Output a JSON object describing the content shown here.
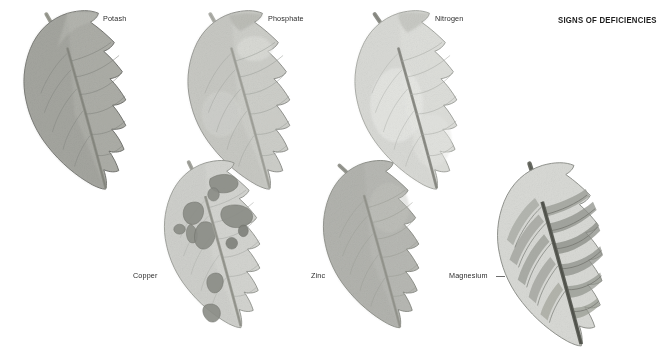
{
  "plate": {
    "title": "SIGNS OF DEFICIENCIES",
    "background_color": "#ffffff",
    "text_color": "#2a2a2a",
    "title_color": "#1d1d1d"
  },
  "specimens": [
    {
      "id": "potash",
      "label": "Potash",
      "row": "top",
      "column": 1,
      "label_x": 103,
      "label_y": 19,
      "blade_tone": "#a9aaa4",
      "blade_tone_light": "#c2c3bd",
      "edge_tone": "#6f716c",
      "vein_tone": "#7d7f79",
      "midrib_tone": "#8c8d86",
      "condition": "uniform dull grey-green blade, darker margins"
    },
    {
      "id": "phosphate",
      "label": "Phosphate",
      "row": "top",
      "column": 2,
      "label_x": 268,
      "label_y": 19,
      "blade_tone": "#cccdc8",
      "blade_tone_light": "#e0e1dd",
      "edge_tone": "#8b8d88",
      "vein_tone": "#9b9d98",
      "midrib_tone": "#a7a8a2",
      "condition": "pale blade, slightly mottled, light margins"
    },
    {
      "id": "nitrogen",
      "label": "Nitrogen",
      "row": "top",
      "column": 3,
      "label_x": 435,
      "label_y": 19,
      "blade_tone": "#dcddd9",
      "blade_tone_light": "#eeefec",
      "edge_tone": "#9a9c97",
      "vein_tone": "#a9aba6",
      "midrib_tone": "#8f908a",
      "condition": "palest blade, overall chlorosis"
    },
    {
      "id": "copper",
      "label": "Copper",
      "row": "bottom",
      "column": 1,
      "label_x": 133,
      "label_y": 276,
      "blade_tone": "#d2d3cf",
      "blade_tone_light": "#e3e4e1",
      "edge_tone": "#8e908b",
      "vein_tone": "#a4a6a1",
      "midrib_tone": "#9d9e97",
      "lesion_tone": "#8a8c86",
      "lesion_edge": "#6b6d67",
      "condition": "pale blade with dark irregular necrotic blotches"
    },
    {
      "id": "zinc",
      "label": "Zinc",
      "row": "bottom",
      "column": 2,
      "label_x": 311,
      "label_y": 276,
      "blade_tone": "#b6b7b2",
      "blade_tone_light": "#c8c9c4",
      "edge_tone": "#84867f",
      "vein_tone": "#95978f",
      "midrib_tone": "#9a9b94",
      "condition": "even mid-grey blade, faint veins"
    },
    {
      "id": "magnesium",
      "label": "Magnesium",
      "row": "bottom",
      "column": 3,
      "label_x": 449,
      "label_y": 276,
      "leader_x": 496,
      "leader_y": 276,
      "leader_w": 9,
      "blade_tone": "#d7d8d4",
      "blade_tone_light": "#e8e9e6",
      "edge_tone": "#8d8f8a",
      "vein_tone": "#787a74",
      "midrib_tone": "#5e6059",
      "band_tone": "#9a9c95",
      "condition": "strong interveinal chlorosis, dark vein bands, heavy midrib"
    }
  ]
}
